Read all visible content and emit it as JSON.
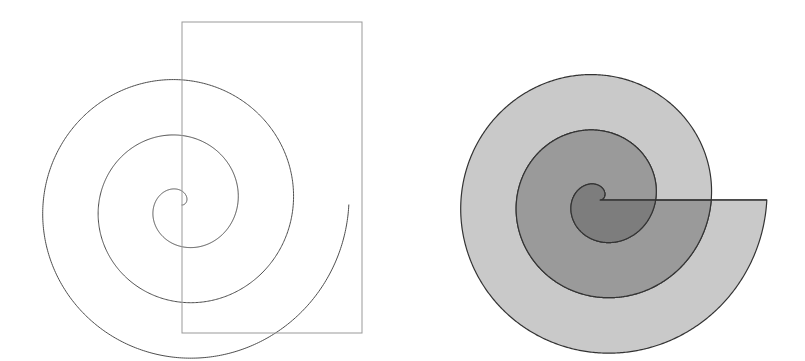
{
  "page": {
    "background_color": "#ffffff",
    "width": 805,
    "height": 361,
    "caption": ""
  },
  "figures": [
    {
      "id": "left-figure",
      "name": "archimedean-spiral-outline-with-rectangle",
      "type": "line-drawing",
      "description": "Archimedean spiral drawn as a single outline curve with an open rectangle overlaid on its right half",
      "stroke_color": "#4d4d4d",
      "stroke_width": 1,
      "fill": "none",
      "pole": {
        "x": 182,
        "y": 205
      },
      "spiral": {
        "kind": "archimedean",
        "equation": "r = a*theta",
        "a_px_per_radian": 8.85,
        "turns": 3.0,
        "theta_start_rad": 0,
        "theta_end_rad": 18.85,
        "direction": "counterclockwise",
        "start_angle_deg": 0,
        "outer_end_point": {
          "x": 352,
          "y": 196
        },
        "turn_radii_px": [
          0,
          55.6,
          111.2,
          166.8
        ]
      },
      "rectangle": {
        "name": "bounding-rectangle",
        "x": 182,
        "y": 22,
        "width": 180,
        "height": 311,
        "stroke_color": "#999999",
        "fill": "none"
      }
    },
    {
      "id": "right-figure",
      "name": "archimedean-spiral-shaded-bands",
      "type": "shaded-region-diagram",
      "description": "Same Archimedean spiral with the areas swept between successive turns filled with graduated grays",
      "stroke_color": "#333333",
      "stroke_width": 1.2,
      "pole": {
        "x": 600,
        "y": 200
      },
      "spiral": {
        "kind": "archimedean",
        "equation": "r = a*theta",
        "a_px_per_radian": 8.85,
        "turns": 3.0,
        "theta_start_rad": 0,
        "theta_end_rad": 18.85,
        "direction": "counterclockwise",
        "start_angle_deg": 0,
        "outer_end_point": {
          "x": 767,
          "y": 200
        },
        "turn_radii_px": [
          0,
          55.6,
          111.2,
          166.8
        ]
      },
      "bands": [
        {
          "name": "inner-band",
          "label": "turn 1 sweep (0 to 2pi)",
          "fill_color": "#7d7d7d",
          "theta_from_rad": 0,
          "theta_to_rad": 6.283,
          "radius_inner_px": 0,
          "radius_outer_px": 55.6
        },
        {
          "name": "middle-band",
          "label": "turn 2 sweep (2pi to 4pi)",
          "fill_color": "#9a9a9a",
          "theta_from_rad": 6.283,
          "theta_to_rad": 12.566,
          "radius_inner_px": 55.6,
          "radius_outer_px": 111.2
        },
        {
          "name": "outer-band",
          "label": "turn 3 sweep (4pi to 6pi)",
          "fill_color": "#c9c9c9",
          "theta_from_rad": 12.566,
          "theta_to_rad": 18.85,
          "radius_inner_px": 111.2,
          "radius_outer_px": 166.8
        }
      ],
      "radial_cut": {
        "name": "terminal-radial-edge",
        "angle_deg": 0,
        "from": {
          "x": 600,
          "y": 200
        },
        "to": {
          "x": 767,
          "y": 200
        }
      }
    }
  ],
  "palette": {
    "background": "#ffffff",
    "outline_dark": "#333333",
    "outline_mid": "#4d4d4d",
    "rectangle_gray": "#999999",
    "shade_dark": "#7d7d7d",
    "shade_medium": "#9a9a9a",
    "shade_light": "#c9c9c9"
  }
}
